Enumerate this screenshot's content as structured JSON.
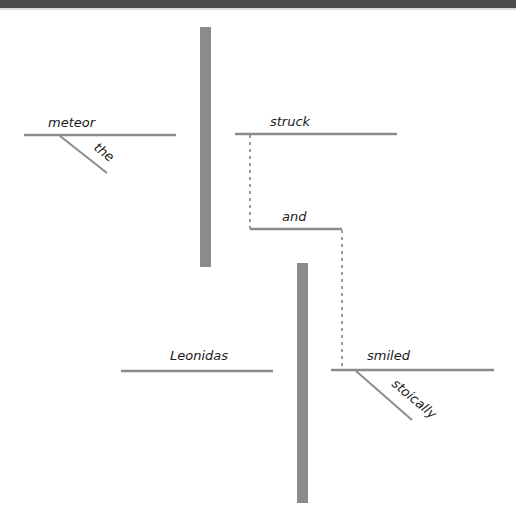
{
  "diagram": {
    "type": "sentence-diagram",
    "sentence_words": [
      "the",
      "meteor",
      "struck",
      "and",
      "Leonidas",
      "smiled",
      "stoically"
    ],
    "clauses": [
      {
        "subject": "meteor",
        "subject_modifiers": [
          "the"
        ],
        "predicate": "struck"
      },
      {
        "subject": "Leonidas",
        "predicate": "smiled",
        "predicate_modifiers": [
          "stoically"
        ]
      }
    ],
    "conjunction": "and",
    "colors": {
      "divider": "#8c8c8c",
      "baseline": "#8c8c8c",
      "dashed_connector": "#9a9a9a",
      "text": "#1a1a1a",
      "top_bar": "#4d4d4d"
    }
  },
  "labels": {
    "meteor": "meteor",
    "the": "the",
    "struck": "struck",
    "and": "and",
    "leonidas": "Leonidas",
    "smiled": "smiled",
    "stoically": "stoically"
  }
}
